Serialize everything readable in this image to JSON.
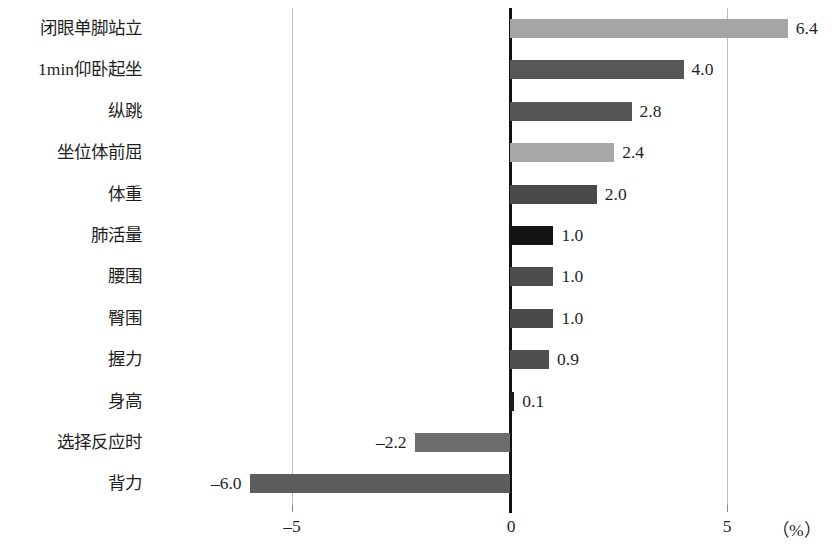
{
  "chart_data": {
    "type": "bar",
    "orientation": "horizontal",
    "title": "",
    "subtitle": "",
    "xlabel": "（%）",
    "ylabel": "",
    "xlim": [
      -7.4,
      7.4
    ],
    "xticks": [
      -5,
      0,
      5
    ],
    "xtick_labels": [
      "–5",
      "0",
      "5"
    ],
    "grid": "vertical gridlines at -5 and 5; heavy zero baseline",
    "legend": "none",
    "categories": [
      "闭眼单脚站立",
      "1min仰卧起坐",
      "纵跳",
      "坐位体前屈",
      "体重",
      "肺活量",
      "腰围",
      "臀围",
      "握力",
      "身高",
      "选择反应时",
      "背力"
    ],
    "values": [
      6.4,
      4.0,
      2.8,
      2.4,
      2.0,
      1.0,
      1.0,
      1.0,
      0.9,
      0.1,
      -2.2,
      -6.0
    ],
    "value_labels": [
      "6.4",
      "4.0",
      "2.8",
      "2.4",
      "2.0",
      "1.0",
      "1.0",
      "1.0",
      "0.9",
      "0.1",
      "–2.2",
      "–6.0"
    ],
    "bar_colors": [
      "#a5a5a5",
      "#575757",
      "#555555",
      "#a8a8a8",
      "#4a4a4a",
      "#141414",
      "#4d4d4d",
      "#4a4a4a",
      "#4f4f4f",
      "#1c1c1c",
      "#6d6d6d",
      "#5d5d5d"
    ],
    "colors": {
      "background": "#ffffff",
      "axis": "#111111",
      "gridline": "#bdbdbd",
      "text": "#1f1f1f"
    }
  }
}
